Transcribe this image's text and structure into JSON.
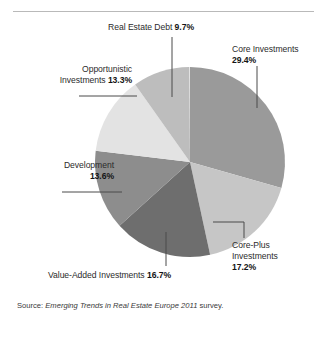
{
  "figure": {
    "width": 327,
    "height": 337,
    "background": "#ffffff",
    "rule_color": "#b9b9b9"
  },
  "source_note": {
    "prefix": "Source: ",
    "title": "Emerging Trends in Real Estate Europe 2011",
    "suffix": " survey."
  },
  "labels": {
    "real_estate_debt": {
      "name": "Real Estate Debt",
      "pct": "9.7%"
    },
    "core": {
      "name": "Core Investments",
      "pct": "29.4%"
    },
    "opportunistic": {
      "name_line1": "Opportunistic",
      "name_line2": "Investments",
      "pct": "13.3%"
    },
    "development": {
      "name": "Development",
      "pct": "13.6%"
    },
    "core_plus": {
      "name_line1": "Core-Plus",
      "name_line2": "Investments",
      "pct": "17.2%"
    },
    "value_added": {
      "name": "Value-Added Investments",
      "pct": "16.7%"
    }
  },
  "chart_data": {
    "type": "pie",
    "title": "",
    "xlabel": "",
    "ylabel": "",
    "legend_position": "callout-labels",
    "grid": false,
    "start_angle_deg": 0,
    "direction": "clockwise",
    "center": {
      "x": 190,
      "y": 162
    },
    "radius": 95,
    "categories": [
      "Core Investments",
      "Core-Plus Investments",
      "Value-Added Investments",
      "Development",
      "Opportunistic Investments",
      "Real Estate Debt"
    ],
    "values": [
      29.4,
      17.2,
      16.7,
      13.6,
      13.3,
      9.7
    ],
    "units": "percent",
    "slices": [
      {
        "label": "Core Investments",
        "value": 29.4,
        "color": "#9a9a9a",
        "start_deg": 0.0,
        "sweep_deg": 105.84
      },
      {
        "label": "Core-Plus Investments",
        "value": 17.2,
        "color": "#c6c6c6",
        "start_deg": 105.84,
        "sweep_deg": 61.92
      },
      {
        "label": "Value-Added Investments",
        "value": 16.7,
        "color": "#6e6e6e",
        "start_deg": 167.76,
        "sweep_deg": 60.12
      },
      {
        "label": "Development",
        "value": 13.6,
        "color": "#8d8d8d",
        "start_deg": 227.88,
        "sweep_deg": 48.96
      },
      {
        "label": "Opportunistic Investments",
        "value": 13.3,
        "color": "#e3e3e3",
        "start_deg": 276.84,
        "sweep_deg": 47.88
      },
      {
        "label": "Real Estate Debt",
        "value": 9.7,
        "color": "#bdbdbd",
        "start_deg": 324.72,
        "sweep_deg": 34.92
      }
    ],
    "leader_line_color": "#4a4a4a"
  }
}
